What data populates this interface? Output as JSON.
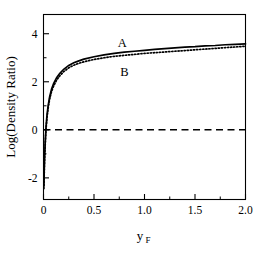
{
  "chart_data": {
    "type": "line",
    "title": "",
    "subtitle": "",
    "xlabel": "y_F",
    "xlabel_base": "y",
    "xlabel_sub": "F",
    "ylabel": "Log(Density Ratio)",
    "xlim": [
      0.0,
      2.0
    ],
    "ylim": [
      -2.9,
      4.8
    ],
    "grid": false,
    "legend": "inline-annotations",
    "x_ticks": [
      0.0,
      0.5,
      1.0,
      1.5,
      2.0
    ],
    "x_tick_labels": [
      "0",
      "0.5",
      "1.0",
      "1.5",
      "2.0"
    ],
    "x_minor_ticks": [
      0.25,
      0.75,
      1.25,
      1.75
    ],
    "y_ticks": [
      -2,
      0,
      2,
      4
    ],
    "y_tick_labels": [
      "-2",
      "0",
      "2",
      "4"
    ],
    "y_minor_ticks": [
      -1,
      1,
      3
    ],
    "annotations": [
      {
        "text": "A",
        "x": 0.78,
        "y": 3.45,
        "describes": "solid-curve"
      },
      {
        "text": "B",
        "x": 0.8,
        "y": 2.25,
        "describes": "dotted-curve"
      }
    ],
    "series": [
      {
        "name": "A",
        "style": "solid",
        "color": "#000000",
        "x": [
          0.004,
          0.008,
          0.012,
          0.018,
          0.025,
          0.034,
          0.045,
          0.06,
          0.08,
          0.1,
          0.13,
          0.16,
          0.2,
          0.25,
          0.3,
          0.35,
          0.4,
          0.5,
          0.6,
          0.7,
          0.8,
          0.9,
          1.0,
          1.1,
          1.2,
          1.3,
          1.4,
          1.5,
          1.6,
          1.7,
          1.8,
          1.9,
          2.0
        ],
        "y": [
          -2.35,
          -1.55,
          -1.0,
          -0.42,
          0.12,
          0.58,
          0.98,
          1.36,
          1.7,
          1.92,
          2.17,
          2.34,
          2.52,
          2.68,
          2.79,
          2.87,
          2.94,
          3.04,
          3.12,
          3.18,
          3.23,
          3.27,
          3.31,
          3.35,
          3.38,
          3.41,
          3.44,
          3.46,
          3.49,
          3.51,
          3.54,
          3.56,
          3.58
        ]
      },
      {
        "name": "B",
        "style": "dotted",
        "color": "#000000",
        "x": [
          0.004,
          0.008,
          0.012,
          0.018,
          0.025,
          0.034,
          0.045,
          0.06,
          0.08,
          0.1,
          0.13,
          0.16,
          0.2,
          0.25,
          0.3,
          0.35,
          0.4,
          0.5,
          0.6,
          0.7,
          0.8,
          0.9,
          1.0,
          1.1,
          1.2,
          1.3,
          1.4,
          1.5,
          1.6,
          1.7,
          1.8,
          1.9,
          2.0
        ],
        "y": [
          -2.45,
          -1.65,
          -1.1,
          -0.52,
          0.02,
          0.48,
          0.88,
          1.26,
          1.6,
          1.82,
          2.07,
          2.24,
          2.42,
          2.58,
          2.69,
          2.77,
          2.83,
          2.93,
          3.0,
          3.06,
          3.1,
          3.14,
          3.18,
          3.21,
          3.24,
          3.27,
          3.3,
          3.33,
          3.36,
          3.39,
          3.42,
          3.45,
          3.48
        ]
      }
    ],
    "reference_line": {
      "name": "zero-line",
      "style": "dashed",
      "y": 0,
      "color": "#000000"
    }
  },
  "colors": {
    "background": "#ffffff",
    "axis": "#000000",
    "curve": "#000000"
  }
}
